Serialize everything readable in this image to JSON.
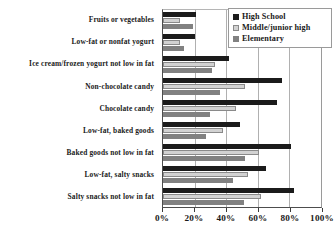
{
  "chart_data": {
    "type": "bar",
    "orientation": "horizontal",
    "title": "",
    "xlabel": "",
    "ylabel": "",
    "xlim": [
      0,
      100
    ],
    "grid": true,
    "legend_position": "top-right",
    "xticks": [
      "0%",
      "20%",
      "40%",
      "60%",
      "80%",
      "100%"
    ],
    "xtick_values": [
      0,
      20,
      40,
      60,
      80,
      100
    ],
    "categories": [
      "Fruits or vegetables",
      "Low-fat or nonfat yogurt",
      "Ice cream/frozen yogurt not low in fat",
      "Non-chocolate candy",
      "Chocolate candy",
      "Low-fat, baked goods",
      "Baked goods not low in fat",
      "Low-fat, salty snacks",
      "Salty snacks not low in fat"
    ],
    "series": [
      {
        "name": "High School",
        "color": "#1b1b1b",
        "values": [
          21,
          20,
          42,
          75,
          72,
          49,
          81,
          65,
          83
        ]
      },
      {
        "name": "Middle/junior high",
        "color": "#d2d2d2",
        "values": [
          11,
          11,
          33,
          52,
          46,
          38,
          61,
          54,
          62
        ]
      },
      {
        "name": "Elementary",
        "color": "#818181",
        "values": [
          19,
          13,
          31,
          36,
          30,
          27,
          52,
          44,
          51
        ]
      }
    ]
  }
}
